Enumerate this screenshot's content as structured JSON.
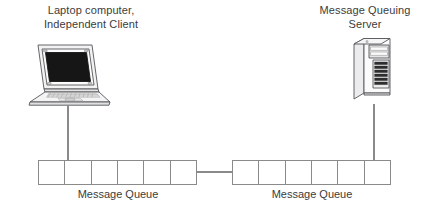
{
  "diagram": {
    "background_color": "#ffffff",
    "line_color": "#808080",
    "text_color": "#3c3c3c",
    "nodes": [
      {
        "id": "client",
        "icon": "laptop-computer-icon",
        "label": "Laptop computer,\nIndependent Client"
      },
      {
        "id": "server",
        "icon": "tower-server-icon",
        "label": "Message Queuing\nServer"
      }
    ],
    "queues": [
      {
        "id": "queue-left",
        "caption": "Message Queue",
        "cells": 6,
        "attached_to": "client"
      },
      {
        "id": "queue-right",
        "caption": "Message Queue",
        "cells": 6,
        "attached_to": "server"
      }
    ],
    "connections": [
      {
        "from": "client",
        "to": "queue-left"
      },
      {
        "from": "queue-left",
        "to": "queue-right"
      },
      {
        "from": "server",
        "to": "queue-right"
      }
    ]
  }
}
